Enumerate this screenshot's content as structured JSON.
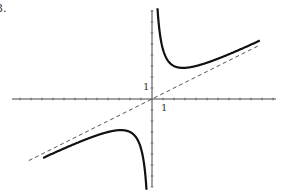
{
  "problem_label": "3.",
  "chart_data": {
    "type": "line",
    "title": "",
    "xlabel": "",
    "ylabel": "",
    "tick_labels": {
      "x": "1",
      "y": "1"
    },
    "grid": false,
    "xlim": [
      -12.5,
      11.5
    ],
    "ylim": [
      -8,
      8.5
    ],
    "series": [
      {
        "name": "curve",
        "style": "solid",
        "formula": "y = x/2 + 4/x",
        "points": [
          [
            0.5,
            8.25
          ],
          [
            1,
            4.5
          ],
          [
            2,
            3
          ],
          [
            2.8,
            2.83
          ],
          [
            4,
            3
          ],
          [
            6,
            3.67
          ],
          [
            9.8,
            5.3
          ]
        ]
      },
      {
        "name": "oblique asymptote",
        "style": "dashed",
        "formula": "y = x/2",
        "points": [
          [
            -11,
            -5.5
          ],
          [
            9.8,
            4.9
          ]
        ]
      }
    ],
    "asymptotes": [
      "x = 0",
      "y = x/2"
    ]
  },
  "geometry": {
    "origin_px": [
      152,
      99
    ],
    "unit_px": 11
  }
}
